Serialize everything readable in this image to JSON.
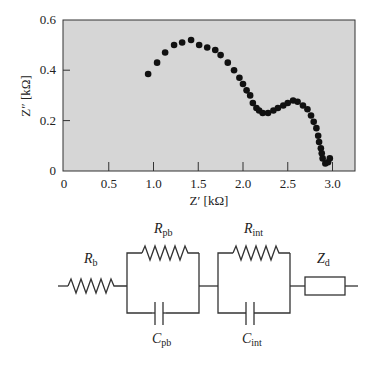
{
  "chart_data": {
    "type": "scatter",
    "title": "",
    "xlabel": "Z′ [kΩ]",
    "ylabel": "Z″ [kΩ]",
    "xlim": [
      0,
      3.25
    ],
    "ylim": [
      0,
      0.6
    ],
    "xticks": [
      0,
      0.5,
      1.0,
      1.5,
      2.0,
      2.5,
      3.0
    ],
    "xtick_labels": [
      "0",
      "0.5",
      "1.0",
      "1.5",
      "2.0",
      "2.5",
      "3.0"
    ],
    "yticks": [
      0,
      0.2,
      0.4,
      0.6
    ],
    "ytick_labels": [
      "0",
      "0.2",
      "0.4",
      "0.6"
    ],
    "grid": false,
    "legend": null,
    "background": "#d6d6d6",
    "marker_color": "#111111",
    "series": [
      {
        "name": "Impedance spectrum (Nyquist)",
        "x": [
          0.94,
          1.04,
          1.13,
          1.23,
          1.32,
          1.42,
          1.51,
          1.6,
          1.69,
          1.75,
          1.83,
          1.9,
          1.96,
          2.0,
          2.04,
          2.08,
          2.11,
          2.15,
          2.18,
          2.22,
          2.28,
          2.34,
          2.39,
          2.45,
          2.5,
          2.56,
          2.61,
          2.67,
          2.72,
          2.76,
          2.79,
          2.82,
          2.84,
          2.85,
          2.87,
          2.88,
          2.89,
          2.92,
          2.95,
          2.97
        ],
        "y": [
          0.385,
          0.43,
          0.47,
          0.5,
          0.51,
          0.52,
          0.5,
          0.49,
          0.48,
          0.46,
          0.43,
          0.4,
          0.37,
          0.345,
          0.32,
          0.3,
          0.27,
          0.25,
          0.24,
          0.23,
          0.23,
          0.24,
          0.25,
          0.26,
          0.27,
          0.28,
          0.275,
          0.26,
          0.245,
          0.22,
          0.195,
          0.17,
          0.14,
          0.115,
          0.09,
          0.07,
          0.05,
          0.03,
          0.035,
          0.05
        ]
      }
    ]
  },
  "circuit": {
    "labels": {
      "rb": {
        "main": "R",
        "sub": "b"
      },
      "rpb": {
        "main": "R",
        "sub": "pb"
      },
      "cpb": {
        "main": "C",
        "sub": "pb"
      },
      "rint": {
        "main": "R",
        "sub": "int"
      },
      "cint": {
        "main": "C",
        "sub": "int"
      },
      "zd": {
        "main": "Z",
        "sub": "d"
      }
    }
  }
}
